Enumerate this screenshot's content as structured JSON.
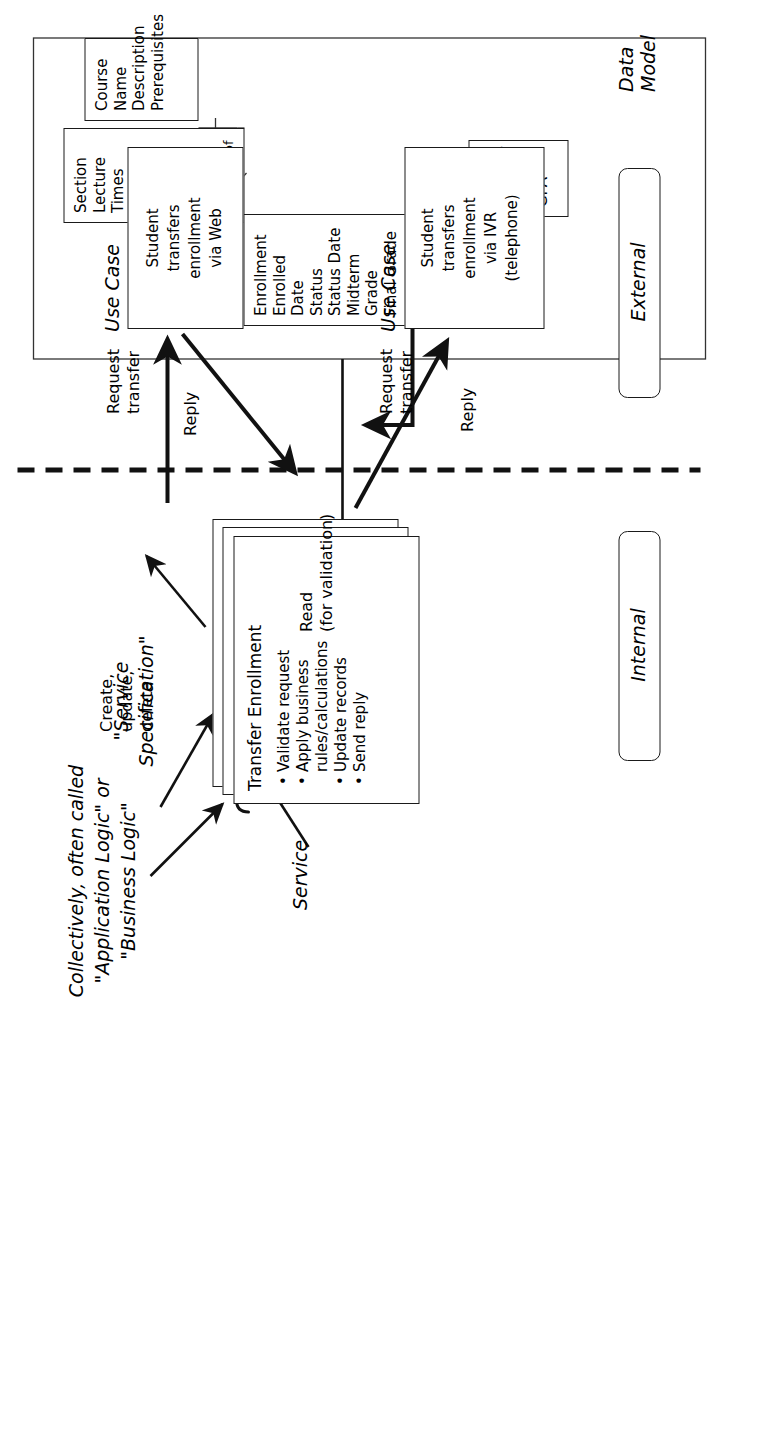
{
  "diagram": {
    "zones": {
      "internal": "Internal",
      "external": "External"
    },
    "annotations": {
      "data_model": "Data Model",
      "service": "Service",
      "service_specification": "\"Service\nSpecification\"",
      "collectively_line1": "Collectively, often called",
      "collectively_line2": "\"Application Logic\" or",
      "collectively_line3": "\"Business Logic\"",
      "create_update_delete": "Create,\nupdate,\ndelete",
      "read_for_validation": "Read\n(for validation)",
      "use_case_label": "Use Case",
      "request_transfer": "Request\ntransfer",
      "reply": "Reply"
    },
    "service": {
      "name": "Transfer Enrollment",
      "steps": [
        "Validate request",
        "Apply business",
        "rules/calculations",
        "Update records",
        "Send reply"
      ],
      "step_is_bullet": [
        true,
        true,
        false,
        true,
        true
      ]
    },
    "use_cases": [
      {
        "label": "Use Case",
        "lines": [
          "Student",
          "transfers",
          "enrollment",
          "via IVR",
          "(telephone)"
        ]
      },
      {
        "label": "Use Case",
        "lines": [
          "Student",
          "transfers",
          "enrollment",
          "via Web"
        ]
      }
    ],
    "data_model": {
      "title": "Data Model",
      "entities": [
        {
          "name": "Course",
          "attributes": [
            "Name",
            "Description",
            "Prerequisites"
          ]
        },
        {
          "name": "Section",
          "attributes": [
            "Lecture Times",
            "Lecture Location",
            "Tutorial Times",
            "Tutorial Location"
          ]
        },
        {
          "name": "Enrollment",
          "attributes": [
            "Enrolled Date",
            "Status",
            "Status Date",
            "Midterm Grade",
            "Final Grade"
          ]
        },
        {
          "name": "Student",
          "attributes": [
            "Number",
            "Name",
            "GPA"
          ]
        }
      ],
      "relationships": [
        {
          "from": "Course",
          "to": "Section",
          "label": "of"
        },
        {
          "from": "Section",
          "to": "Enrollment",
          "label": "in"
        },
        {
          "from": "Student",
          "to": "Enrollment",
          "label": "of"
        }
      ]
    },
    "colors": {
      "line": "#1a1a1a",
      "background": "#ffffff",
      "text": "#000000"
    }
  }
}
